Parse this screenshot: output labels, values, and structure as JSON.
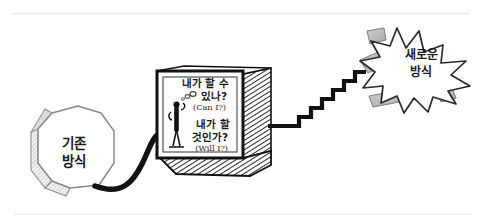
{
  "figure": {
    "title_alt": "Hand-drawn diagram: existing method to new method via two questions",
    "background_color": "#ffffff",
    "ink_color": "#1a1a1a",
    "shade_color": "#9a9a9a",
    "rule_color": "#e8e8e8"
  },
  "rules": {
    "top_label": "top-divider-rule",
    "bottom_label": "bottom-divider-rule"
  },
  "octagon": {
    "name": "existing-method-octagon",
    "line1": "기존",
    "line2": "방식",
    "meaning": "existing method"
  },
  "cable": {
    "name": "curved-cable-connector"
  },
  "box": {
    "name": "decision-box",
    "question1_line1": "내가 할 수",
    "question1_line2": "있나?",
    "question1_english": "(Can I?)",
    "question2_line1": "내가 할",
    "question2_line2": "것인가?",
    "question2_english": "(Will I?)",
    "figure_label": "stick-figure-person",
    "thought_label": "thought-bubble-trail"
  },
  "staircase": {
    "name": "staircase-connector",
    "steps": 6
  },
  "starburst": {
    "name": "new-method-starburst",
    "line1": "새로운",
    "line2": "방식",
    "meaning": "new method"
  }
}
